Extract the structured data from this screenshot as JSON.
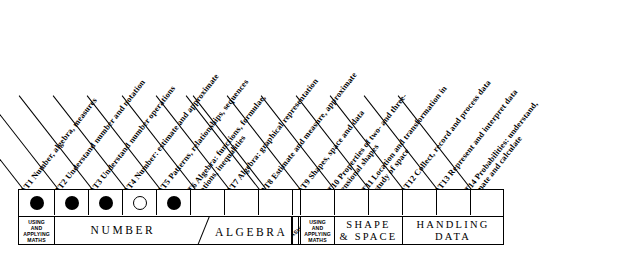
{
  "columns": [
    {
      "id": "AT1",
      "label": "AT1  Number, algebra, measures",
      "marker": "filled"
    },
    {
      "id": "AT2",
      "label": "AT2  Understand number and notation",
      "marker": "filled"
    },
    {
      "id": "AT3",
      "label": "AT3  Understand number operations",
      "marker": "filled"
    },
    {
      "id": "AT4",
      "label": "AT4  Number: estimate and approximate",
      "marker": "open"
    },
    {
      "id": "AT5",
      "label": "AT5  Patterns, relationships, sequences",
      "marker": "filled"
    },
    {
      "id": "AT6",
      "label": "AT6  Algebra: functions, formulae, equations, inequalities",
      "marker": "none"
    },
    {
      "id": "AT7",
      "label": "AT7  Algebra: graphical representation",
      "marker": "none"
    },
    {
      "id": "AT8",
      "label": "AT8  Estimate and measure, approximate",
      "marker": "none"
    },
    {
      "id": "AT9",
      "label": "AT9  Shapes, space and data",
      "marker": "none"
    },
    {
      "id": "AT10",
      "label": "AT10  Properties of two- and three-dimensional shapes",
      "marker": "none"
    },
    {
      "id": "AT11",
      "label": "AT11  Location and transformation in the study of space",
      "marker": "none"
    },
    {
      "id": "AT12",
      "label": "AT12  Collect, record and process data",
      "marker": "none"
    },
    {
      "id": "AT13",
      "label": "AT13  Represent and interpret data",
      "marker": "none"
    },
    {
      "id": "AT14",
      "label": "AT14  Probabilities: understand, estimate and calculate",
      "marker": "none"
    }
  ],
  "groups": [
    {
      "key": "using1",
      "label": "USING AND APPLYING MATHS",
      "style": "small"
    },
    {
      "key": "number",
      "label": "NUMBER",
      "style": "wide"
    },
    {
      "key": "algebra",
      "label": "ALGEBRA",
      "style": "wide"
    },
    {
      "key": "measures",
      "label": "MEASURES",
      "style": "rot"
    },
    {
      "key": "using2",
      "label": "USING AND APPLYING MATHS",
      "style": "small"
    },
    {
      "key": "shape",
      "label": "SHAPE & SPACE",
      "style": "wide"
    },
    {
      "key": "handling",
      "label": "HANDLING DATA",
      "style": "wide"
    }
  ],
  "group_text": {
    "using_line1": "USING",
    "using_line2": "AND",
    "using_line3": "APPLYING",
    "using_line4": "MATHS",
    "number": "NUMBER",
    "algebra": "ALGEBRA",
    "measures": "MEASURES",
    "shape_line1": "SHAPE",
    "shape_line2": "& SPACE",
    "handling_line1": "HANDLING",
    "handling_line2": "DATA"
  },
  "colors": {
    "ink": "#000000",
    "paper": "#ffffff"
  }
}
